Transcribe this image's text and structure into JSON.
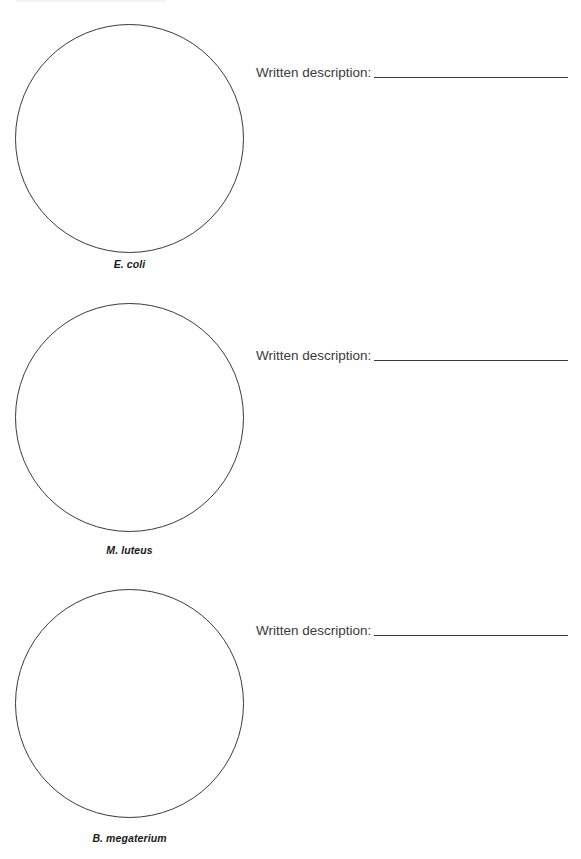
{
  "worksheet": {
    "specimens": [
      {
        "name": "E. coli",
        "description_label": "Written description:",
        "description_value": ""
      },
      {
        "name": "M. luteus",
        "description_label": "Written description:",
        "description_value": ""
      },
      {
        "name": "B. megaterium",
        "description_label": "Written description:",
        "description_value": ""
      }
    ]
  }
}
